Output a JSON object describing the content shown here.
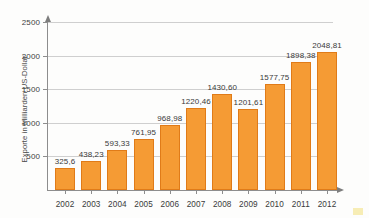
{
  "chart_data": {
    "type": "bar",
    "title": "",
    "xlabel": "",
    "ylabel": "Exporte in Milliarden US-Dollar",
    "categories": [
      "2002",
      "2003",
      "2004",
      "2005",
      "2006",
      "2007",
      "2008",
      "2009",
      "2010",
      "2011",
      "2012"
    ],
    "values": [
      325.6,
      438.23,
      593.33,
      761.95,
      968.98,
      1220.46,
      1430.6,
      1201.61,
      1577.75,
      1898.38,
      2048.81
    ],
    "value_labels": [
      "325,6",
      "438,23",
      "593,33",
      "761,95",
      "968,98",
      "1220,46",
      "1430,60",
      "1201,61",
      "1577,75",
      "1898,38",
      "2048,81"
    ],
    "ylim": [
      0,
      2500
    ],
    "yticks": [
      500,
      1000,
      1500,
      2000,
      2500
    ],
    "ytick_labels": [
      "500",
      "1000",
      "1500",
      "2000",
      "2500"
    ],
    "grid": true,
    "legend": false,
    "series": [
      {
        "name": "Exporte in Milliarden US-Dollar",
        "color": "#F59B34",
        "border_color": "#E07B18",
        "values": [
          325.6,
          438.23,
          593.33,
          761.95,
          968.98,
          1220.46,
          1430.6,
          1201.61,
          1577.75,
          1898.38,
          2048.81
        ]
      }
    ],
    "colors": {
      "bar_fill": "#F59B34",
      "bar_border": "#E07B18",
      "gridline": "#cfcfcf",
      "axis": "#8d8d8d",
      "text": "#3a3a3a"
    }
  }
}
